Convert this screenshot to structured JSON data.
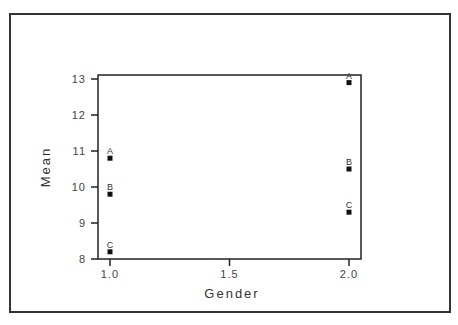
{
  "chart_data": {
    "type": "scatter",
    "title": "",
    "xlabel": "Gender",
    "ylabel": "Mean",
    "xlim": [
      1.0,
      2.0
    ],
    "ylim": [
      8,
      13
    ],
    "x_ticks": [
      "1.0",
      "1.5",
      "2.0"
    ],
    "y_ticks": [
      "8",
      "9",
      "10",
      "11",
      "12",
      "13"
    ],
    "grid": false,
    "legend": null,
    "series": [
      {
        "name": "A",
        "x": [
          1.0,
          2.0
        ],
        "values": [
          10.8,
          12.9
        ]
      },
      {
        "name": "B",
        "x": [
          1.0,
          2.0
        ],
        "values": [
          9.8,
          10.5
        ]
      },
      {
        "name": "C",
        "x": [
          1.0,
          2.0
        ],
        "values": [
          8.2,
          9.3
        ]
      }
    ]
  },
  "colors": {
    "marker": "#111111",
    "axis": "#222222",
    "frame": "#333333"
  }
}
